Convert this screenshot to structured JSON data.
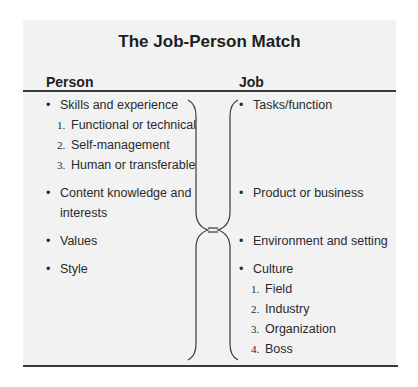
{
  "title": "The Job-Person Match",
  "columns": {
    "person_header": "Person",
    "job_header": "Job"
  },
  "person": {
    "items": [
      {
        "label": "Skills and experience",
        "subitems": [
          {
            "num": "1.",
            "label": "Functional or technical"
          },
          {
            "num": "2.",
            "label": "Self-management"
          },
          {
            "num": "3.",
            "label": "Human or transferable"
          }
        ]
      },
      {
        "label": "Content knowledge and",
        "label_line2": "interests"
      },
      {
        "label": "Values"
      },
      {
        "label": "Style"
      }
    ]
  },
  "job": {
    "items": [
      {
        "label": "Tasks/function"
      },
      {
        "label": "Product or business"
      },
      {
        "label": "Environment and setting"
      },
      {
        "label": "Culture",
        "subitems": [
          {
            "num": "1.",
            "label": "Field"
          },
          {
            "num": "2.",
            "label": "Industry"
          },
          {
            "num": "3.",
            "label": "Organization"
          },
          {
            "num": "4.",
            "label": "Boss"
          }
        ]
      }
    ]
  },
  "connector": {
    "symbol": "=",
    "icon": "double-brace-equals-icon"
  },
  "bullet_glyph": "•"
}
